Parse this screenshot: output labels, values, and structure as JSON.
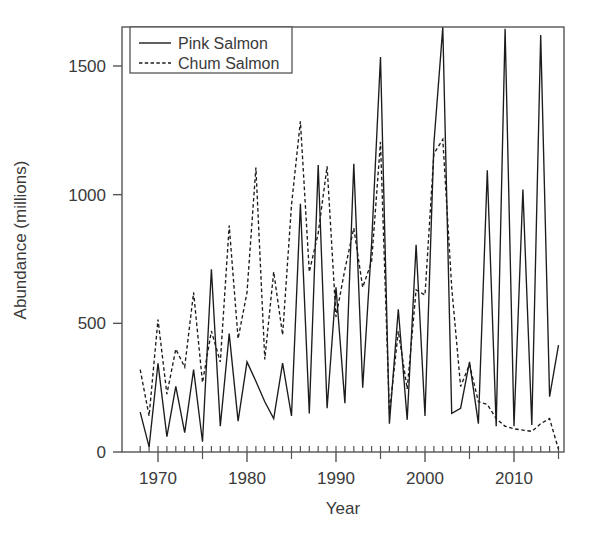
{
  "chart_data": {
    "type": "line",
    "title": "",
    "xlabel": "Year",
    "ylabel": "Abundance (millions)",
    "xlim": [
      1967.2,
      1916.0
    ],
    "x_axis_range": [
      1967.2,
      2016.2
    ],
    "ylim": [
      -40,
      1700
    ],
    "grid": false,
    "legend_position": "top-left",
    "y_ticks": [
      0,
      500,
      1000,
      1500
    ],
    "y_tick_labels": [
      "0",
      "500",
      "1000",
      "1500"
    ],
    "x_ticks": [
      1970,
      1980,
      1990,
      2000,
      2010
    ],
    "x_tick_labels": [
      "1970",
      "1980",
      "1990",
      "2000",
      "2010"
    ],
    "x_minor_ticks": [
      1975,
      1985,
      1995,
      2005,
      2015
    ],
    "x": [
      1968,
      1969,
      1970,
      1971,
      1972,
      1973,
      1974,
      1975,
      1976,
      1977,
      1978,
      1979,
      1980,
      1981,
      1982,
      1983,
      1984,
      1985,
      1986,
      1987,
      1988,
      1989,
      1990,
      1991,
      1992,
      1993,
      1994,
      1995,
      1996,
      1997,
      1998,
      1999,
      2000,
      2001,
      2002,
      2003,
      2004,
      2005,
      2006,
      2007,
      2008,
      2009,
      2010,
      2011,
      2012,
      2013,
      2014,
      2015
    ],
    "series": [
      {
        "name": "Pink Salmon",
        "style": "solid",
        "color": "#1c1c1c",
        "values": [
          155,
          20,
          345,
          60,
          255,
          75,
          320,
          40,
          710,
          100,
          460,
          120,
          350,
          275,
          195,
          130,
          345,
          140,
          965,
          150,
          1115,
          170,
          640,
          190,
          1120,
          250,
          810,
          1535,
          110,
          555,
          125,
          805,
          140,
          1200,
          1650,
          150,
          170,
          350,
          110,
          1095,
          100,
          1645,
          100,
          1020,
          105,
          1620,
          215,
          415
        ]
      },
      {
        "name": "Chum Salmon",
        "style": "dashed",
        "color": "#1c1c1c",
        "values": [
          320,
          140,
          515,
          225,
          400,
          330,
          620,
          270,
          470,
          350,
          880,
          440,
          620,
          1105,
          360,
          700,
          455,
          960,
          1285,
          700,
          850,
          1110,
          525,
          710,
          870,
          640,
          740,
          1205,
          150,
          470,
          245,
          630,
          610,
          1160,
          1215,
          640,
          255,
          340,
          195,
          185,
          130,
          100,
          90,
          85,
          80,
          110,
          130,
          10
        ]
      }
    ]
  },
  "legend": {
    "entries": [
      {
        "label": "Pink Salmon"
      },
      {
        "label": "Chum Salmon"
      }
    ]
  },
  "axes": {
    "x_title": "Year",
    "y_title": "Abundance (millions)"
  }
}
